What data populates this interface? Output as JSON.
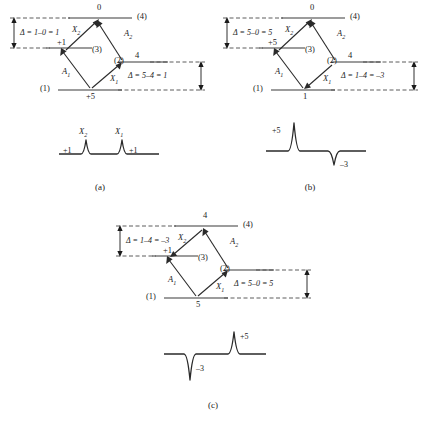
{
  "figure": {
    "caption_a": "(a)",
    "caption_b": "(b)",
    "caption_c": "(c)"
  },
  "panels": [
    {
      "id": "a",
      "levels": {
        "l1_tag": "(1)",
        "l1_value": "+5",
        "l2_tag": "(2)",
        "l2_value": "4",
        "l3_tag": "(3)",
        "l3_value": "+1",
        "l4_tag": "(4)",
        "l4_value": "0"
      },
      "transitions": {
        "a1": "A",
        "a1_sub": "1",
        "a2": "A",
        "a2_sub": "2",
        "x1": "X",
        "x1_sub": "1",
        "x2": "X",
        "x2_sub": "2"
      },
      "delta_left": "Δ = 1–0 = 1",
      "delta_right": "Δ = 5–4 = 1",
      "arrow_dirs": {
        "a1": "up",
        "a2": "up",
        "x1": "up",
        "x2": "up"
      },
      "spectrum": {
        "peaks": [
          {
            "label": "X",
            "sub": "2",
            "value": "+1",
            "sign": "positive"
          },
          {
            "label": "X",
            "sub": "1",
            "value": "+1",
            "sign": "positive"
          }
        ]
      }
    },
    {
      "id": "b",
      "levels": {
        "l1_tag": "(1)",
        "l1_value": "1",
        "l2_tag": "(2)",
        "l2_value": "4",
        "l3_tag": "(3)",
        "l3_value": "+5",
        "l4_tag": "(4)",
        "l4_value": "0"
      },
      "transitions": {
        "a1": "A",
        "a1_sub": "1",
        "a2": "A",
        "a2_sub": "2",
        "x1": "X",
        "x1_sub": "1",
        "x2": "X",
        "x2_sub": "2"
      },
      "delta_left": "Δ = 5–0 = 5",
      "delta_right": "Δ = 1–4 = –3",
      "arrow_dirs": {
        "a1": "up",
        "a2": "up",
        "x1": "down",
        "x2": "up"
      },
      "spectrum": {
        "peaks": [
          {
            "label": "",
            "sub": "",
            "value": "+5",
            "sign": "positive"
          },
          {
            "label": "",
            "sub": "",
            "value": "–3",
            "sign": "negative"
          }
        ]
      }
    },
    {
      "id": "c",
      "levels": {
        "l1_tag": "(1)",
        "l1_value": "5",
        "l2_tag": "(2)",
        "l2_value": "",
        "l3_tag": "(3)",
        "l3_value": "+1",
        "l4_tag": "(4)",
        "l4_value": "4"
      },
      "transitions": {
        "a1": "A",
        "a1_sub": "1",
        "a2": "A",
        "a2_sub": "2",
        "x1": "X",
        "x1_sub": "1",
        "x2": "X",
        "x2_sub": "2"
      },
      "delta_left": "Δ = 1–4 = –3",
      "delta_right": "Δ = 5–0 = 5",
      "arrow_dirs": {
        "a1": "up",
        "a2": "up",
        "x1": "up",
        "x2": "down"
      },
      "spectrum": {
        "peaks": [
          {
            "label": "",
            "sub": "",
            "value": "–3",
            "sign": "negative"
          },
          {
            "label": "",
            "sub": "",
            "value": "+5",
            "sign": "positive"
          }
        ]
      }
    }
  ],
  "colors": {
    "ink": "#1a1a1a",
    "line": "#3a3a3a",
    "dashed": "#4a4a4a"
  }
}
